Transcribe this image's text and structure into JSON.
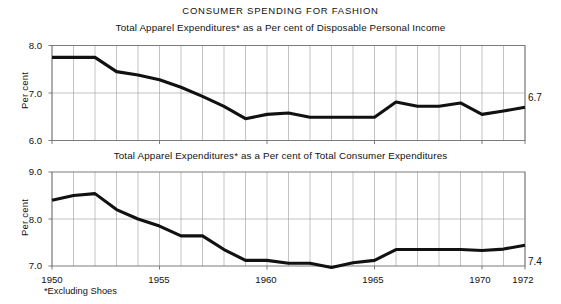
{
  "figure": {
    "title": "CONSUMER SPENDING FOR FASHION",
    "footnote": "*Excluding Shoes"
  },
  "chart_data": [
    {
      "type": "line",
      "title": "CONSUMER SPENDING FOR FASHION",
      "subtitle": "Total Apparel Expenditures* as a Per cent of Disposable Personal Income",
      "xlabel": "",
      "ylabel": "Per cent",
      "ylim": [
        6.0,
        8.0
      ],
      "xlim": [
        1950,
        1972
      ],
      "yticks": [
        6.0,
        7.0,
        8.0
      ],
      "ytick_labels": [
        "6.0",
        "7.0",
        "8.0"
      ],
      "xticks": [
        1950,
        1955,
        1960,
        1965,
        1970,
        1972
      ],
      "xtick_labels": [
        "1950",
        "1955",
        "1960",
        "1965",
        "1970",
        "1972"
      ],
      "grid": true,
      "legend": "none",
      "end_label": "6.7",
      "x": [
        1950,
        1951,
        1952,
        1953,
        1954,
        1955,
        1956,
        1957,
        1958,
        1959,
        1960,
        1961,
        1962,
        1963,
        1964,
        1965,
        1966,
        1967,
        1968,
        1969,
        1970,
        1971,
        1972
      ],
      "values": [
        7.75,
        7.75,
        7.75,
        7.45,
        7.38,
        7.28,
        7.12,
        6.93,
        6.72,
        6.46,
        6.55,
        6.58,
        6.49,
        6.49,
        6.49,
        6.49,
        6.81,
        6.72,
        6.72,
        6.79,
        6.55,
        6.62,
        6.7
      ]
    },
    {
      "type": "line",
      "subtitle": "Total Apparel Expenditures* as a Per cent of Total Consumer Expenditures",
      "xlabel": "",
      "ylabel": "Per cent",
      "ylim": [
        7.0,
        9.0
      ],
      "xlim": [
        1950,
        1972
      ],
      "yticks": [
        7.0,
        8.0,
        9.0
      ],
      "ytick_labels": [
        "7.0",
        "8.0",
        "9.0"
      ],
      "xticks": [
        1950,
        1955,
        1960,
        1965,
        1970,
        1972
      ],
      "xtick_labels": [
        "1950",
        "1955",
        "1960",
        "1965",
        "1970",
        "1972"
      ],
      "grid": true,
      "legend": "none",
      "end_label": "7.4",
      "x": [
        1950,
        1951,
        1952,
        1953,
        1954,
        1955,
        1956,
        1957,
        1958,
        1959,
        1960,
        1961,
        1962,
        1963,
        1964,
        1965,
        1966,
        1967,
        1968,
        1969,
        1970,
        1971,
        1972
      ],
      "values": [
        8.4,
        8.5,
        8.54,
        8.2,
        8.0,
        7.85,
        7.64,
        7.64,
        7.35,
        7.12,
        7.12,
        7.06,
        7.06,
        6.97,
        7.07,
        7.12,
        7.35,
        7.35,
        7.35,
        7.35,
        7.33,
        7.36,
        7.44
      ]
    }
  ]
}
